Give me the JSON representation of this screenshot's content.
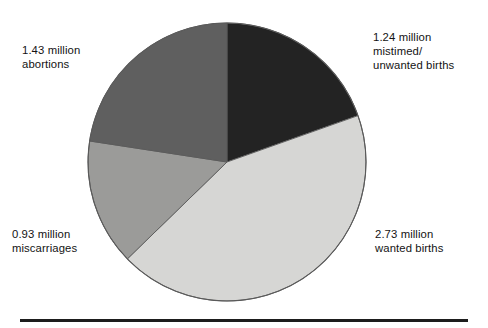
{
  "chart_data": {
    "type": "pie",
    "title": "",
    "subtitle": "",
    "xlabel": "",
    "ylabel": "",
    "units": "million",
    "total": 6.33,
    "legend_position": "outside-labels",
    "grid": false,
    "start_angle_deg": 0,
    "direction": "clockwise",
    "categories": [
      "mistimed/unwanted births",
      "wanted births",
      "miscarriages",
      "abortions"
    ],
    "values": [
      1.24,
      2.73,
      0.93,
      1.43
    ],
    "slices": [
      {
        "name": "mistimed-unwanted-births",
        "value": 1.24,
        "value_text": "1.24 million",
        "label_text": "1.24 million\nmistimed/\nunwanted births",
        "color": "#232323",
        "start_angle_deg": 0,
        "end_angle_deg": 70.5,
        "percent": 19.6
      },
      {
        "name": "wanted-births",
        "value": 2.73,
        "value_text": "2.73 million",
        "label_text": "2.73 million\nwanted births",
        "color": "#d6d6d4",
        "start_angle_deg": 70.5,
        "end_angle_deg": 225.8,
        "percent": 43.1
      },
      {
        "name": "miscarriages",
        "value": 0.93,
        "value_text": "0.93 million",
        "label_text": "0.93 million\nmiscarriages",
        "color": "#9b9b99",
        "start_angle_deg": 225.8,
        "end_angle_deg": 278.7,
        "percent": 14.7
      },
      {
        "name": "abortions",
        "value": 1.43,
        "value_text": "1.43 million",
        "label_text": "1.43 million\nabortions",
        "color": "#5f5f5f",
        "start_angle_deg": 278.7,
        "end_angle_deg": 360,
        "percent": 22.6
      }
    ]
  },
  "labels": {
    "mistimed_unwanted_births": "1.24 million\nmistimed/\nunwanted births",
    "wanted_births": "2.73 million\nwanted births",
    "miscarriages": "0.93 million\nmiscarriages",
    "abortions": "1.43 million\nabortions"
  },
  "colors": {
    "slice_black": "#232323",
    "slice_light_gray": "#d6d6d4",
    "slice_medium_gray": "#9b9b99",
    "slice_dark_gray": "#5f5f5f",
    "outline": "#5a5a5a",
    "rule": "#1d1d1d",
    "background": "#ffffff",
    "text": "#131313"
  },
  "geometry": {
    "center_x": 140,
    "center_y": 140,
    "radius": 139
  }
}
